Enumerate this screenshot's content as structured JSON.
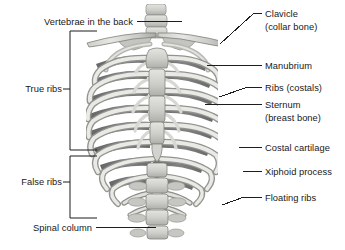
{
  "diagram": {
    "background_color": "#ffffff",
    "text_color": "#18181a",
    "line_color": "#1d1d1f",
    "bone_light": "#dcdcda",
    "bone_mid": "#b8b8b5",
    "bone_shadow": "#6f6f6f",
    "bone_dark": "#555555"
  },
  "labels_left": [
    {
      "id": "vertebrae-in-the-back",
      "text": "Vertebrae in the back",
      "x": 133,
      "y": 16
    },
    {
      "id": "true-ribs",
      "text": "True ribs",
      "x": 62,
      "y": 83
    },
    {
      "id": "false-ribs",
      "text": "False ribs",
      "x": 62,
      "y": 176
    },
    {
      "id": "spinal-column",
      "text": "Spinal column",
      "x": 92,
      "y": 222
    }
  ],
  "labels_right": [
    {
      "id": "clavicle",
      "line1": "Clavicle",
      "line2": "(collar bone)",
      "x": 265,
      "y": 8
    },
    {
      "id": "manubrium",
      "line1": "Manubrium",
      "line2": "",
      "x": 265,
      "y": 60
    },
    {
      "id": "ribs-costals",
      "line1": "Ribs (costals)",
      "line2": "",
      "x": 265,
      "y": 82
    },
    {
      "id": "sternum",
      "line1": "Sternum",
      "line2": "(breast bone)",
      "x": 265,
      "y": 99
    },
    {
      "id": "costal-cartilage",
      "line1": "Costal cartilage",
      "line2": "",
      "x": 265,
      "y": 142
    },
    {
      "id": "xiphoid-process",
      "line1": "Xiphoid process",
      "line2": "",
      "x": 265,
      "y": 166
    },
    {
      "id": "floating-ribs",
      "line1": "Floating ribs",
      "line2": "",
      "x": 265,
      "y": 192
    }
  ],
  "brackets": [
    {
      "id": "true-ribs-bracket",
      "x": 70,
      "top": 31,
      "bottom": 150,
      "arm": 27,
      "tick_y": 89
    },
    {
      "id": "false-ribs-bracket",
      "x": 70,
      "top": 156,
      "bottom": 218,
      "arm": 27,
      "tick_y": 182
    }
  ],
  "leaders": [
    {
      "id": "vertebrae-leader",
      "x1": 137,
      "y1": 21,
      "x2": 182,
      "y2": 21
    },
    {
      "id": "spinal-column-leader",
      "x1": 96,
      "y1": 227,
      "x2": 156,
      "y2": 227
    },
    {
      "id": "clavicle-leader",
      "x1": 262,
      "y1": 13,
      "x2": 253,
      "y2": 13
    },
    {
      "id": "clavicle-leader-diagonal",
      "x1": 253,
      "y1": 14,
      "x2": 220,
      "y2": 44
    },
    {
      "id": "manubrium-leader",
      "x1": 262,
      "y1": 65,
      "x2": 207,
      "y2": 65
    },
    {
      "id": "ribs-costals-leader",
      "x1": 262,
      "y1": 87,
      "x2": 248,
      "y2": 87
    },
    {
      "id": "ribs-costals-leader-diagonal",
      "x1": 248,
      "y1": 87,
      "x2": 219,
      "y2": 97
    },
    {
      "id": "sternum-leader",
      "x1": 262,
      "y1": 104,
      "x2": 205,
      "y2": 104
    },
    {
      "id": "costal-cartilage-leader",
      "x1": 262,
      "y1": 147,
      "x2": 239,
      "y2": 147
    },
    {
      "id": "xiphoid-process-leader",
      "x1": 262,
      "y1": 171,
      "x2": 243,
      "y2": 171
    },
    {
      "id": "floating-ribs-leader",
      "x1": 262,
      "y1": 197,
      "x2": 244,
      "y2": 197
    },
    {
      "id": "floating-ribs-leader-diagonal",
      "x1": 244,
      "y1": 197,
      "x2": 222,
      "y2": 205
    }
  ]
}
